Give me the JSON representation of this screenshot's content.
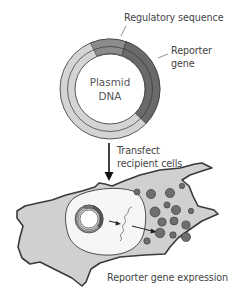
{
  "figure": {
    "plasmid": {
      "label_line1": "Plasmid",
      "label_line2": "DNA",
      "regulatory_label": "Regulatory sequence",
      "reporter_label_line1": "Reporter",
      "reporter_label_line2": "gene"
    },
    "step": {
      "label_line1": "Transfect",
      "label_line2": "recipient cells"
    },
    "cell": {
      "caption": "Reporter gene expression"
    },
    "colors": {
      "backbone": "#d2d2d2",
      "regulatory": "#8a8a8a",
      "reporter": "#6a6a6a",
      "cytoplasm": "#d0d0d0",
      "nucleus": "#f5f5f5",
      "protein": "#6e6e6e",
      "outline": "#3a3a3a"
    }
  }
}
